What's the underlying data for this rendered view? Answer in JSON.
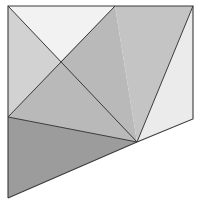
{
  "figure": {
    "stroke_color": "#3a3a3a",
    "regions": [
      {
        "name": "top-triangle",
        "points": "8,6 115,6 61,61",
        "fill": "#f2f2f2"
      },
      {
        "name": "left-triangle",
        "points": "8,6 61,61 8,117",
        "fill": "#d2d2d2"
      },
      {
        "name": "center-quad",
        "points": "61,61 115,6 137,142 8,117",
        "fill": "#b9b9b9"
      },
      {
        "name": "right-parallelogram",
        "points": "115,6 193,6 137,142",
        "fill": "#c4c4c4"
      },
      {
        "name": "right-quad",
        "points": "193,6 193,119 137,142",
        "fill": "#ebebeb"
      },
      {
        "name": "bottom-triangle",
        "points": "8,117 137,142 8,198",
        "fill": "#9c9c9c"
      }
    ],
    "lines": [
      {
        "name": "diagonal-main",
        "x1": 8,
        "y1": 6,
        "x2": 137,
        "y2": 142
      },
      {
        "name": "diagonal-secondary",
        "x1": 115,
        "y1": 6,
        "x2": 8,
        "y2": 117
      },
      {
        "name": "slant-right",
        "x1": 193,
        "y1": 6,
        "x2": 137,
        "y2": 142
      },
      {
        "name": "center-to-bottom",
        "x1": 8,
        "y1": 117,
        "x2": 137,
        "y2": 142
      }
    ]
  }
}
